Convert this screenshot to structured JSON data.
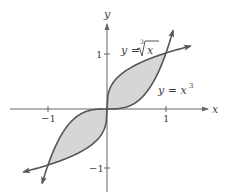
{
  "diagram": {
    "type": "function-graph",
    "axes": {
      "x_label": "x",
      "y_label": "y",
      "x_ticks": [
        {
          "value": -1,
          "label": "−1"
        },
        {
          "value": 1,
          "label": "1"
        }
      ],
      "y_ticks": [
        {
          "value": 1,
          "label": "1"
        },
        {
          "value": -1,
          "label": "−1"
        }
      ]
    },
    "curves": [
      {
        "name": "cube-root",
        "label_lhs": "y = ",
        "label_index": "3",
        "label_radicand": "x",
        "expression": "y = ∛x"
      },
      {
        "name": "cubic",
        "label_lhs": "y = x",
        "label_exp": "3",
        "expression": "y = x³"
      }
    ],
    "shaded_regions": [
      "between curves on [-1, 0]",
      "between curves on [0, 1]"
    ],
    "intersections": [
      [
        -1,
        -1
      ],
      [
        0,
        0
      ],
      [
        1,
        1
      ]
    ],
    "colors": {
      "curve": "#555555",
      "axis": "#666666",
      "fill": "#d6d6d6",
      "text": "#444444"
    }
  }
}
